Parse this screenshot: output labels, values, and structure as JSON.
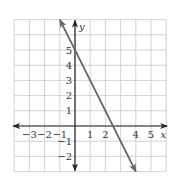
{
  "chart_data": {
    "type": "line",
    "title": "",
    "xlabel": "x",
    "ylabel": "y",
    "xlim": [
      -4,
      6
    ],
    "ylim": [
      -3,
      7
    ],
    "grid": true,
    "x_tick_labels": [
      "−3",
      "−2",
      "−1",
      "1",
      "2",
      "4",
      "5"
    ],
    "x_ticks": [
      -3,
      -2,
      -1,
      1,
      2,
      4,
      5
    ],
    "y_tick_labels": [
      "−2",
      "−1",
      "1",
      "2",
      "3",
      "4",
      "5"
    ],
    "y_ticks": [
      -2,
      -1,
      1,
      2,
      3,
      4,
      5
    ],
    "series": [
      {
        "name": "line",
        "equation": "y = -2x + 5",
        "slope": -2,
        "y_intercept": 5,
        "x_intercept": 2.5,
        "x": [
          -1,
          4
        ],
        "y": [
          7,
          -3
        ],
        "arrows": "both",
        "color": "#666666"
      }
    ]
  },
  "colors": {
    "grid": "#c8c8c8",
    "axes": "#222222",
    "line": "#666666"
  }
}
